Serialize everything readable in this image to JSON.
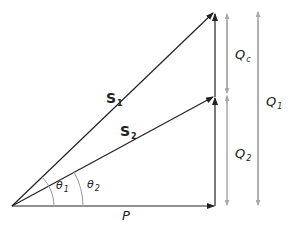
{
  "diagram": {
    "type": "power-triangle",
    "labels": {
      "S1": {
        "main": "S",
        "sub": "1"
      },
      "S2": {
        "main": "S",
        "sub": "2"
      },
      "theta1": {
        "main": "θ",
        "sub": "1"
      },
      "theta2": {
        "main": "θ",
        "sub": "2"
      },
      "P": {
        "main": "P"
      },
      "Qc": {
        "main": "Q",
        "sub": "c"
      },
      "Q1": {
        "main": "Q",
        "sub": "1"
      },
      "Q2": {
        "main": "Q",
        "sub": "2"
      }
    },
    "colors": {
      "vector": "#222222",
      "dimension": "#aaaaaa",
      "arc": "#999999"
    }
  }
}
